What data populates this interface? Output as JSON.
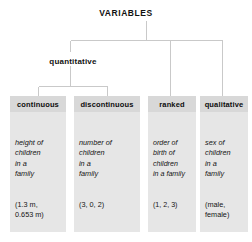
{
  "diagram": {
    "title": "VARIABLES",
    "type": "hierarchy-tree",
    "intermediate_node": "quantitative",
    "line_color": "#c9c9c9",
    "box_fill": "#e6e6e6",
    "header_fill": "#d8d8d8",
    "text_color": "#141414",
    "categories": [
      {
        "id": "continuous",
        "label": "continuous",
        "parent": "quantitative",
        "example_lines": [
          "height of",
          "children",
          "in a",
          "family"
        ],
        "value_lines": [
          "(1.3 m,",
          "0.653 m)"
        ]
      },
      {
        "id": "discontinuous",
        "label": "discontinuous",
        "parent": "quantitative",
        "example_lines": [
          "number of",
          "children",
          "in a",
          "family"
        ],
        "value_lines": [
          "(3, 0, 2)"
        ]
      },
      {
        "id": "ranked",
        "label": "ranked",
        "parent": "VARIABLES",
        "example_lines": [
          "order of",
          "birth of",
          "children",
          "in a family"
        ],
        "value_lines": [
          "(1, 2, 3)"
        ]
      },
      {
        "id": "qualitative",
        "label": "qualitative",
        "parent": "VARIABLES",
        "example_lines": [
          "sex of",
          "children",
          "in a",
          "family"
        ],
        "value_lines": [
          "(male,",
          "female)"
        ]
      }
    ]
  }
}
